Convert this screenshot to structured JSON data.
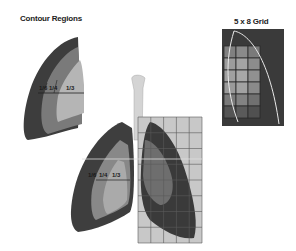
{
  "panels": {
    "contour": {
      "title": "Contour Regions",
      "fractions": [
        "1/6",
        "1/4",
        "1/3"
      ],
      "colors": {
        "outer": "#3d3d3d",
        "middle": "#7a7a7a",
        "inner": "#b5b5b5"
      }
    },
    "grid": {
      "title": "5 x 8 Grid",
      "columns": 5,
      "rows": 8,
      "colors": {
        "background": "#3a3a3a",
        "cell_light": "#9a9a9a",
        "cell_mid": "#7e7e7e",
        "outline": "#e8e8e8"
      }
    },
    "lungs": {
      "fractions": [
        "1/6",
        "1/4",
        "1/3"
      ],
      "grid_columns": 5,
      "grid_rows": 8
    }
  }
}
